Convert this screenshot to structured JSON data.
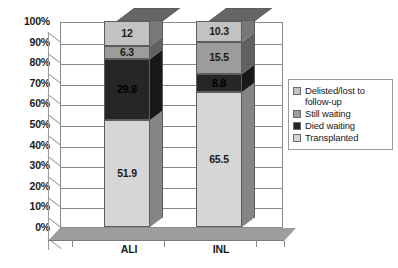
{
  "chart_data": {
    "type": "bar",
    "subtype": "100% stacked bar (3D)",
    "title": "",
    "xlabel": "",
    "ylabel": "",
    "categories": [
      "ALI",
      "INL"
    ],
    "ylim": [
      0,
      100
    ],
    "ytick_labels": [
      "100%",
      "90%",
      "80%",
      "70%",
      "60%",
      "50%",
      "40%",
      "30%",
      "20%",
      "10%",
      "0%"
    ],
    "ytick_values": [
      100,
      90,
      80,
      70,
      60,
      50,
      40,
      30,
      20,
      10,
      0
    ],
    "grid": true,
    "legend_position": "right",
    "stack_order_bottom_to_top": [
      "Transplanted",
      "Died waiting",
      "Still waiting",
      "Delisted/lost to follow-up"
    ],
    "series": [
      {
        "name": "Delisted/lost to follow-up",
        "color": "#c2c2c2",
        "values": [
          12,
          10.3
        ],
        "labels": [
          "12",
          "10.3"
        ]
      },
      {
        "name": "Still waiting",
        "color": "#9c9c9c",
        "values": [
          6.3,
          15.5
        ],
        "labels": [
          "6.3",
          "15.5"
        ]
      },
      {
        "name": "Died waiting",
        "color": "#262626",
        "values": [
          29.8,
          8.8
        ],
        "labels": [
          "29.8",
          "8.8"
        ]
      },
      {
        "name": "Transplanted",
        "color": "#d6d6d6",
        "values": [
          51.9,
          65.5
        ],
        "labels": [
          "51.9",
          "65.5"
        ]
      }
    ]
  },
  "legend": {
    "items": [
      {
        "label": "Delisted/lost to follow-up",
        "color": "#c2c2c2"
      },
      {
        "label": "Still waiting",
        "color": "#9c9c9c"
      },
      {
        "label": "Died waiting",
        "color": "#262626"
      },
      {
        "label": "Transplanted",
        "color": "#d6d6d6"
      }
    ]
  },
  "axes": {
    "y_labels": [
      "100%",
      "90%",
      "80%",
      "70%",
      "60%",
      "50%",
      "40%",
      "30%",
      "20%",
      "10%",
      "0%"
    ],
    "x_labels": [
      "ALI",
      "INL"
    ]
  }
}
